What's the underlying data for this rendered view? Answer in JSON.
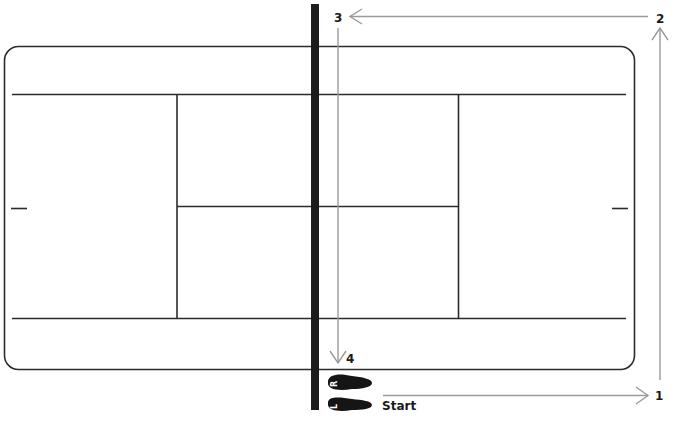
{
  "diagram": {
    "colors": {
      "court_line": "#2b2b2b",
      "net": "#1c1c1c",
      "path_arrow": "#9a9a9a",
      "foot": "#151515",
      "label": "#1a1a1a"
    },
    "waypoints": [
      {
        "id": "1",
        "label": "1"
      },
      {
        "id": "2",
        "label": "2"
      },
      {
        "id": "3",
        "label": "3"
      },
      {
        "id": "4",
        "label": "4"
      }
    ],
    "start_label": "Start",
    "feet": [
      {
        "side": "right",
        "letter": "R"
      },
      {
        "side": "left",
        "letter": "L"
      }
    ]
  }
}
